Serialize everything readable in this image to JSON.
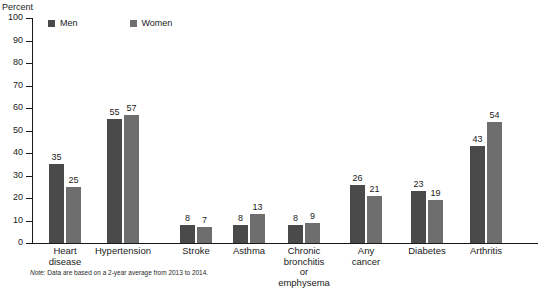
{
  "chart_data": {
    "type": "bar",
    "title": "",
    "subtitle": "",
    "xlabel": "",
    "ylabel": "Percent",
    "ylim": [
      0,
      100
    ],
    "grid": false,
    "legend_position": "top-left",
    "categories": [
      "Heart\ndisease",
      "Hypertension",
      "Stroke",
      "Asthma",
      "Chronic bronchitis\nor emphysema",
      "Any\ncancer",
      "Diabetes",
      "Arthritis"
    ],
    "series": [
      {
        "name": "Men",
        "color": "#4a4a4a",
        "values": [
          35,
          55,
          8,
          8,
          8,
          26,
          23,
          43
        ]
      },
      {
        "name": "Women",
        "color": "#6e6e6e",
        "values": [
          25,
          57,
          7,
          13,
          9,
          21,
          19,
          54
        ]
      }
    ],
    "y_ticks": [
      0,
      10,
      20,
      30,
      40,
      50,
      60,
      70,
      80,
      90,
      100
    ],
    "note": "Note: Data are based on a 2-year average from 2013 to 2014.",
    "note_prefix": "Note:",
    "note_body": " Data are based on a 2-year average from 2013 to 2014."
  },
  "axis": {
    "y_title": "Percent"
  },
  "legend": {
    "items": [
      {
        "label": "Men",
        "color": "#4a4a4a"
      },
      {
        "label": "Women",
        "color": "#6e6e6e"
      }
    ]
  },
  "colors": {
    "men": "#4a4a4a",
    "women": "#6e6e6e",
    "axis": "#1a1a1a",
    "background": "#ffffff"
  }
}
